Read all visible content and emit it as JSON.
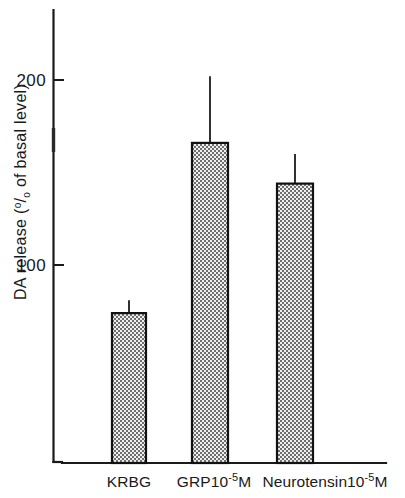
{
  "chart_data": {
    "type": "bar",
    "title": "",
    "subtitle": "",
    "xlabel": "",
    "ylabel": "DA release (% of basal level)",
    "ylabel_parts": {
      "prefix": "DA release (",
      "percent_numerator": "o",
      "percent_slash": "/",
      "percent_denominator": "o",
      "suffix": " of basal level)"
    },
    "categories": [
      "KRBG",
      "GRP10⁻⁵M",
      "Neurotensin10⁻⁵M"
    ],
    "category_parts": [
      {
        "base": "KRBG",
        "exponent": "",
        "tail": ""
      },
      {
        "base": "GRP10",
        "exponent": "-5",
        "tail": "M"
      },
      {
        "base": "Neurotensin10",
        "exponent": "-5",
        "tail": "M"
      }
    ],
    "values": [
      74,
      166,
      144
    ],
    "errors_upper": [
      81,
      202,
      160
    ],
    "error_bars": [
      7,
      36,
      16
    ],
    "ylim": [
      0,
      239
    ],
    "yticks": [
      100,
      200
    ],
    "ytick_labels": [
      "100",
      "200"
    ],
    "yminor_ticks": [
      150
    ],
    "grid": false,
    "legend": "none",
    "bar_fill": "#9a9a9a",
    "bar_pattern": "checkerboard-dither",
    "bar_edge_color": "#111111",
    "axis_color": "#1a1a1a",
    "background": "#ffffff"
  },
  "geometry": {
    "y_axis_x": 53,
    "y_axis_top": 10,
    "y_axis_bottom": 462,
    "x_axis_y": 463,
    "x_axis_left": 53,
    "x_axis_right": 386,
    "value_zero_y": 450,
    "px_per_unit": 1.85,
    "bars": [
      {
        "x": 112,
        "width": 34
      },
      {
        "x": 192,
        "width": 36
      },
      {
        "x": 277,
        "width": 36
      }
    ],
    "tick_y": {
      "100": 265,
      "200": 80
    },
    "minor_tick_y": {
      "150": 140
    }
  }
}
